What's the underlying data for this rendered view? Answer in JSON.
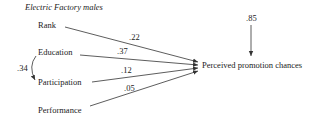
{
  "diagram": {
    "title": "Electric Factory males",
    "predictors": [
      {
        "label": "Rank",
        "coefficient": ".22"
      },
      {
        "label": "Education",
        "coefficient": ".37"
      },
      {
        "label": "Participation",
        "coefficient": ".12"
      },
      {
        "label": "Performance",
        "coefficient": ".05"
      }
    ],
    "correlation": {
      "from": "Education",
      "to": "Participation",
      "value": ".34"
    },
    "outcome": {
      "label": "Perceived promotion chances",
      "residual": ".85"
    }
  }
}
